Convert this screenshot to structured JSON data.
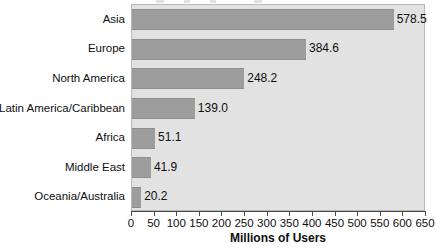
{
  "chart_data": {
    "type": "bar",
    "orientation": "horizontal",
    "title": "",
    "xlabel": "Millions of Users",
    "ylabel": "",
    "xlim": [
      0,
      650
    ],
    "xticks": [
      0,
      50,
      100,
      150,
      200,
      250,
      300,
      350,
      400,
      450,
      500,
      550,
      600,
      650
    ],
    "xtick_labels": [
      "0",
      "50",
      "100",
      "150",
      "200",
      "250",
      "300",
      "350",
      "400",
      "450",
      "500",
      "550",
      "600",
      "650"
    ],
    "grid": false,
    "legend": false,
    "categories": [
      "Asia",
      "Europe",
      "North America",
      "Latin America/Caribbean",
      "Africa",
      "Middle East",
      "Oceania/Australia"
    ],
    "values": [
      578.5,
      384.6,
      248.2,
      139.0,
      51.1,
      41.9,
      20.2
    ],
    "value_labels": [
      "578.5",
      "384.6",
      "248.2",
      "139.0",
      "51.1",
      "41.9",
      "20.2"
    ],
    "bar_color": "#9d9d9d",
    "plot_background": "#e2e2e2",
    "page_background": "#ffffff",
    "text_color": "#0f0f0f"
  }
}
